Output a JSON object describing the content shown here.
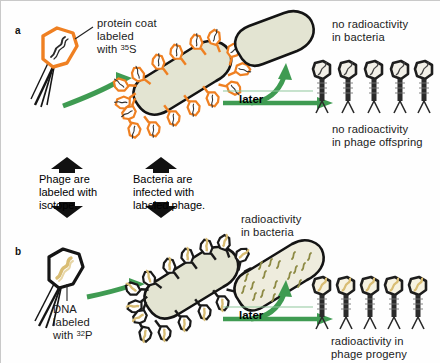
{
  "figure": {
    "background_color": "#fefefe",
    "accent_orange": "#ef8022",
    "accent_green": "#3f9b52",
    "bacteria_fill": "#e3e4d2",
    "dna_tan": "#e8d7a8",
    "phage_black": "#1a1a1a"
  },
  "panel_a": {
    "label": "a",
    "phage_caption_line1": "protein coat",
    "phage_caption_line2": "labeled",
    "phage_caption_line3_prefix": "with ",
    "phage_caption_isotope_sup": "35",
    "phage_caption_isotope_el": "S",
    "later_label": "later",
    "result_top": "no radioactivity\nin bacteria",
    "result_bottom": "no radioactivity\nin phage offspring",
    "progeny_count": 5,
    "attached_phage_count": 16
  },
  "middle": {
    "box_left": "Phage are\nlabeled with\nisotope.",
    "box_right": "Bacteria are\ninfected with\nlabeled phage."
  },
  "panel_b": {
    "label": "b",
    "phage_caption_line1": "DNA",
    "phage_caption_line2": "labeled",
    "phage_caption_line3_prefix": "with ",
    "phage_caption_isotope_sup": "32",
    "phage_caption_isotope_el": "P",
    "later_label": "later",
    "result_top": "radioactivity\nin bacteria",
    "result_bottom": "radioactivity in\nphage progeny",
    "progeny_count": 5,
    "attached_phage_count": 16
  }
}
